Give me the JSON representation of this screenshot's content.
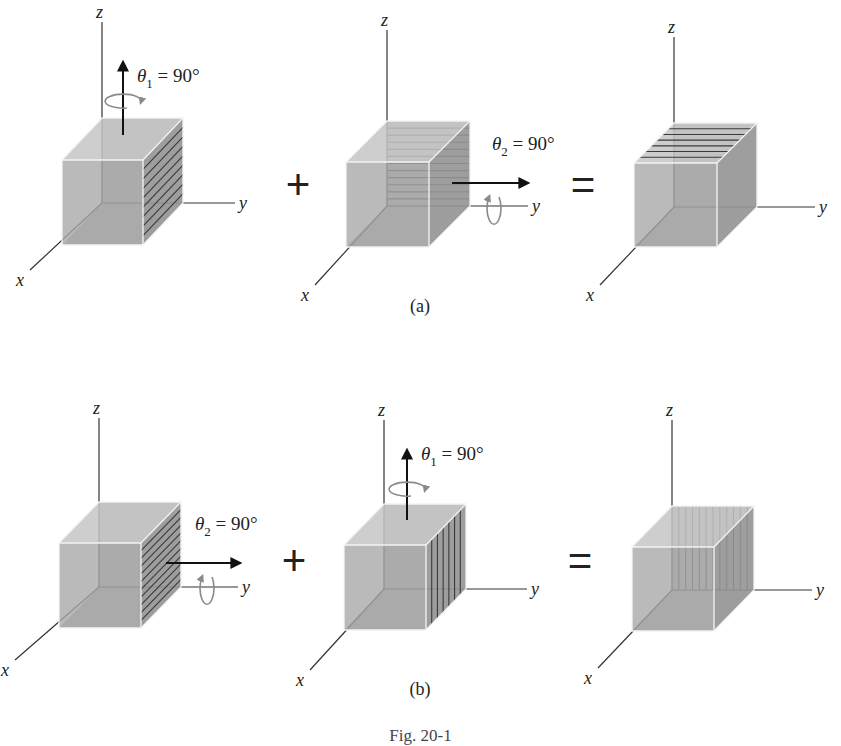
{
  "figure": {
    "caption": "Fig. 20-1",
    "colors": {
      "background": "#ffffff",
      "face_front": "#a9a9a9",
      "face_top": "#c6c6c6",
      "face_right": "#9a9a9a",
      "face_back": "#b4b4b4",
      "edge": "#f4f4f4",
      "stripe": "#3a3a3a",
      "axis": "#333333",
      "arrow": "#111111",
      "rotation_arrow": "#8a8a8a"
    },
    "rows": [
      {
        "label": "(a)",
        "label_pos": [
          420,
          312
        ],
        "operators": [
          {
            "symbol": "+",
            "pos": [
              298,
              185
            ]
          },
          {
            "symbol": "=",
            "pos": [
              583,
              185
            ]
          }
        ],
        "cubes": [
          {
            "id": "a1",
            "front": [
              62,
              160,
              143,
              245
            ],
            "offset": [
              40,
              -42
            ],
            "z_axis_top": 22,
            "y_axis_end": 235,
            "x_axis_end": [
              30,
              270
            ],
            "stripes": {
              "face": "right",
              "dir": "horizontal",
              "count": 8
            },
            "rotation": {
              "label_sym": "θ",
              "sub": "1",
              "value": " = 90°",
              "axis": "z",
              "arrow_from": [
                123,
                135
              ],
              "arrow_to": [
                123,
                62
              ],
              "label_pos": [
                137,
                82
              ]
            },
            "axis_labels": {
              "x": "x",
              "y": "y",
              "z": "z"
            }
          },
          {
            "id": "a2",
            "front": [
              346,
              162,
              429,
              247
            ],
            "offset": [
              41,
              -41
            ],
            "z_axis_top": 30,
            "y_axis_end": 528,
            "x_axis_end": [
              315,
              285
            ],
            "stripes": {
              "face": "back",
              "dir": "horizontal",
              "count": 11
            },
            "rotation": {
              "label_sym": "θ",
              "sub": "2",
              "value": " = 90°",
              "axis": "y",
              "arrow_from": [
                452,
                183
              ],
              "arrow_to": [
                528,
                183
              ],
              "label_pos": [
                492,
                150
              ]
            },
            "axis_labels": {
              "x": "x",
              "y": "y",
              "z": "z"
            }
          },
          {
            "id": "a3",
            "front": [
              634,
              163,
              717,
              247
            ],
            "offset": [
              40,
              -40
            ],
            "z_axis_top": 37,
            "y_axis_end": 815,
            "x_axis_end": [
              600,
              285
            ],
            "stripes": {
              "face": "top",
              "dir": "horizontal",
              "count": 6
            },
            "rotation": null,
            "axis_labels": {
              "x": "x",
              "y": "y",
              "z": "z"
            }
          }
        ]
      },
      {
        "label": "(b)",
        "label_pos": [
          420,
          695
        ],
        "operators": [
          {
            "symbol": "+",
            "pos": [
              294,
              561
            ]
          },
          {
            "symbol": "=",
            "pos": [
              580,
              561
            ]
          }
        ],
        "cubes": [
          {
            "id": "b1",
            "front": [
              59,
              543,
              141,
              628
            ],
            "offset": [
              40,
              -41
            ],
            "z_axis_top": 418,
            "y_axis_end": 238,
            "x_axis_end": [
              15,
              660
            ],
            "stripes": {
              "face": "right",
              "dir": "slant",
              "count": 10
            },
            "rotation": {
              "label_sym": "θ",
              "sub": "2",
              "value": " = 90°",
              "axis": "y",
              "arrow_from": [
                166,
                563
              ],
              "arrow_to": [
                240,
                563
              ],
              "label_pos": [
                195,
                530
              ]
            },
            "axis_labels": {
              "x": "x",
              "y": "y",
              "z": "z"
            }
          },
          {
            "id": "b2",
            "front": [
              344,
              545,
              426,
              630
            ],
            "offset": [
              40,
              -41
            ],
            "z_axis_top": 420,
            "y_axis_end": 527,
            "x_axis_end": [
              310,
              670
            ],
            "stripes": {
              "face": "right",
              "dir": "vertical",
              "count": 6
            },
            "rotation": {
              "label_sym": "θ",
              "sub": "1",
              "value": " = 90°",
              "axis": "z",
              "arrow_from": [
                407,
                520
              ],
              "arrow_to": [
                407,
                450
              ],
              "label_pos": [
                421,
                460
              ]
            },
            "axis_labels": {
              "x": "x",
              "y": "y",
              "z": "z"
            }
          },
          {
            "id": "b3",
            "front": [
              632,
              547,
              714,
              631
            ],
            "offset": [
              40,
              -41
            ],
            "z_axis_top": 420,
            "y_axis_end": 812,
            "x_axis_end": [
              598,
              668
            ],
            "stripes": {
              "face": "back",
              "dir": "vertical",
              "count": 11
            },
            "rotation": null,
            "axis_labels": {
              "x": "x",
              "y": "y",
              "z": "z"
            }
          }
        ]
      }
    ]
  }
}
